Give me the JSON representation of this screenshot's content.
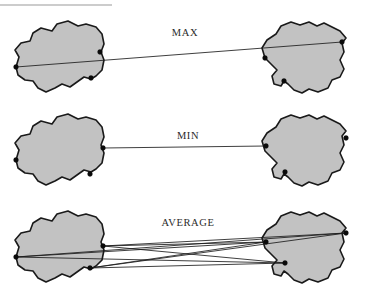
{
  "figure": {
    "title_rule": {
      "name": "top-horizontal-rule",
      "x1": 0,
      "y1": 5,
      "x2": 112,
      "y2": 5,
      "color": "#9a9a9a"
    },
    "colors": {
      "blob_fill": "#c2c2c2",
      "blob_stroke": "#1a1a1a",
      "line": "#1c1c1c",
      "point": "#0a0a0a",
      "text": "#2b2b2b",
      "background": "#ffffff"
    },
    "rows": [
      {
        "id": "max",
        "label": "MAX",
        "label_x": 185,
        "label_y": 36,
        "description": "Maximum distance (complete linkage) between two clusters",
        "link_count": 1,
        "links": [
          {
            "from": "L0",
            "to": "R0"
          }
        ]
      },
      {
        "id": "min",
        "label": "MIN",
        "label_x": 188,
        "label_y": 139,
        "description": "Minimum distance (single linkage) between two clusters",
        "link_count": 1,
        "links": [
          {
            "from": "L1",
            "to": "R1"
          }
        ]
      },
      {
        "id": "average",
        "label": "AVERAGE",
        "label_x": 188,
        "label_y": 226,
        "description": "Average distance between all pairs of points in two clusters",
        "link_count": 9,
        "links": [
          {
            "from": "L0",
            "to": "R0"
          },
          {
            "from": "L0",
            "to": "R1"
          },
          {
            "from": "L0",
            "to": "R2"
          },
          {
            "from": "L1",
            "to": "R0"
          },
          {
            "from": "L1",
            "to": "R1"
          },
          {
            "from": "L1",
            "to": "R2"
          },
          {
            "from": "L2",
            "to": "R0"
          },
          {
            "from": "L2",
            "to": "R1"
          },
          {
            "from": "L2",
            "to": "R2"
          }
        ]
      }
    ],
    "clusters": {
      "max_left": {
        "points": {
          "L0": [
            16,
            67
          ],
          "L1": [
            100,
            52
          ],
          "L2": [
            91,
            78
          ]
        }
      },
      "max_right": {
        "points": {
          "R0": [
            342,
            42
          ],
          "R1": [
            265,
            58
          ],
          "R2": [
            284,
            81
          ]
        }
      },
      "min_left": {
        "points": {
          "L0": [
            16,
            160
          ],
          "L1": [
            103,
            148
          ],
          "L2": [
            90,
            174
          ]
        }
      },
      "min_right": {
        "points": {
          "R0": [
            346,
            138
          ],
          "R1": [
            266,
            146
          ],
          "R2": [
            285,
            172
          ]
        }
      },
      "avg_left": {
        "points": {
          "L0": [
            16,
            257
          ],
          "L1": [
            103,
            246
          ],
          "L2": [
            90,
            268
          ]
        }
      },
      "avg_right": {
        "points": {
          "R0": [
            346,
            233
          ],
          "R1": [
            266,
            242
          ],
          "R2": [
            285,
            263
          ]
        }
      }
    },
    "blob_shapes": {
      "left": "M 16,67 L 19,57 L 15,50 L 21,43 L 30,41 L 33,33 L 41,28 L 52,31 L 57,24 L 68,21 L 78,26 L 86,24 L 96,27 L 102,34 L 104,44 L 101,52 L 104,60 L 102,70 L 96,76 L 91,79 L 84,77 L 77,82 L 70,87 L 62,84 L 55,88 L 46,92 L 38,88 L 33,81 L 25,80 L 18,75 Z",
      "right": "M 265,58 L 262,48 L 267,40 L 276,34 L 281,26 L 291,22 L 300,25 L 309,22 L 317,26 L 324,23 L 332,27 L 340,31 L 346,38 L 342,43 L 344,52 L 340,60 L 344,69 L 340,77 L 332,80 L 328,88 L 318,92 L 309,89 L 302,93 L 294,90 L 288,84 L 284,81 L 281,86 L 274,84 L 272,76 L 277,70 L 271,64 Z"
    }
  }
}
